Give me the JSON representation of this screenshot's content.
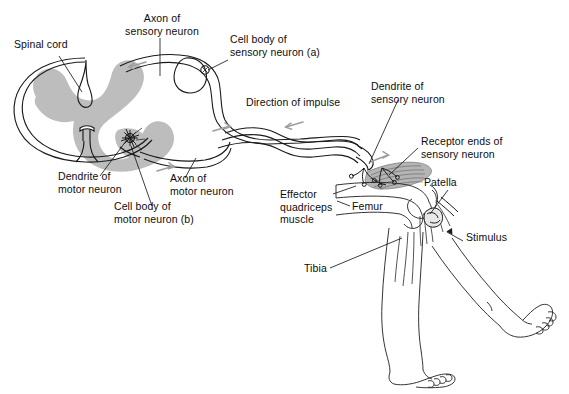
{
  "figure": {
    "type": "anatomical-diagram",
    "background_color": "#ffffff",
    "line_color": "#1a1a1a",
    "gray_matter_color": "#bdbdbd",
    "muscle_color": "#9a9a9a"
  },
  "labels": {
    "spinal_cord": "Spinal cord",
    "axon_sensory": "Axon of\nsensory neuron",
    "cell_body_sensory": "Cell body of\nsensory neuron (a)",
    "direction_of_impulse": "Direction of impulse",
    "dendrite_sensory": "Dendrite of\nsensory neuron",
    "receptor_ends": "Receptor ends of\nsensory neuron",
    "patella": "Patella",
    "stimulus": "Stimulus",
    "femur": "Femur",
    "tibia": "Tibia",
    "effector_muscle": "Effector\nquadriceps\nmuscle",
    "dendrite_motor": "Dendrite of\nmotor neuron",
    "cell_body_motor": "Cell body of\nmotor neuron (b)",
    "axon_motor": "Axon of\nmotor neuron"
  },
  "structures": [
    {
      "name": "spinal-cord-cross-section",
      "label": "Spinal cord"
    },
    {
      "name": "gray-matter-butterfly",
      "label": "Gray matter"
    },
    {
      "name": "dorsal-root-ganglion",
      "label": "Cell body of sensory neuron (a)"
    },
    {
      "name": "sensory-neuron-axon",
      "label": "Axon of sensory neuron"
    },
    {
      "name": "motor-neuron-cell-body",
      "label": "Cell body of motor neuron (b)"
    },
    {
      "name": "motor-neuron-axon",
      "label": "Axon of motor neuron"
    },
    {
      "name": "quadriceps-muscle",
      "label": "Effector quadriceps muscle"
    },
    {
      "name": "femur-bone",
      "label": "Femur"
    },
    {
      "name": "tibia-bone",
      "label": "Tibia"
    },
    {
      "name": "patella-bone",
      "label": "Patella"
    },
    {
      "name": "reflex-hammer",
      "label": "Stimulus"
    },
    {
      "name": "hanging-leg",
      "label": "Resting leg"
    },
    {
      "name": "kicking-leg",
      "label": "Extended leg (reflex response)"
    }
  ],
  "impulse_arrows": [
    {
      "name": "arrow-dorsal-inbound",
      "direction": "left"
    },
    {
      "name": "arrow-nerve-inbound",
      "direction": "left"
    },
    {
      "name": "arrow-nerve-outbound",
      "direction": "right"
    },
    {
      "name": "arrow-ventral-outbound",
      "direction": "right"
    },
    {
      "name": "arrow-to-muscle",
      "direction": "right"
    }
  ]
}
